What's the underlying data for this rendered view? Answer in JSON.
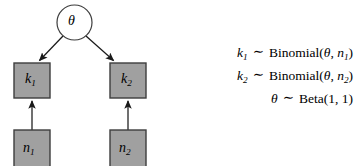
{
  "figure": {
    "type": "probabilistic-graphical-model",
    "background_color": "#ffffff",
    "node_fill_color": "#a0a0a0",
    "node_stroke_color": "#3d3d3d",
    "edge_color": "#1a1a1a"
  },
  "graph": {
    "nodes": [
      {
        "id": "theta",
        "shape": "circle",
        "label": "θ",
        "subscript": "",
        "observed": false,
        "cx": 74.5,
        "cy": 22.5,
        "r": 17.5
      },
      {
        "id": "k1",
        "shape": "square",
        "label": "k",
        "subscript": "1",
        "observed": true,
        "x": 14,
        "y": 63,
        "w": 36,
        "h": 35
      },
      {
        "id": "k2",
        "shape": "square",
        "label": "k",
        "subscript": "2",
        "observed": true,
        "x": 110,
        "y": 63,
        "w": 36,
        "h": 35
      },
      {
        "id": "n1",
        "shape": "square",
        "label": "n",
        "subscript": "1",
        "observed": true,
        "x": 14,
        "y": 130,
        "w": 36,
        "h": 36
      },
      {
        "id": "n2",
        "shape": "square",
        "label": "n",
        "subscript": "2",
        "observed": true,
        "x": 110,
        "y": 130,
        "w": 36,
        "h": 36
      }
    ],
    "edges": [
      {
        "from": "theta",
        "to": "k1",
        "style": "arrow"
      },
      {
        "from": "theta",
        "to": "k2",
        "style": "arrow"
      },
      {
        "from": "n1",
        "to": "k1",
        "style": "arrow"
      },
      {
        "from": "n2",
        "to": "k2",
        "style": "arrow"
      }
    ]
  },
  "equations": [
    {
      "lhs": "k",
      "lhs_sub": "1",
      "relation": "∼",
      "distribution": "Binomial",
      "params": [
        {
          "text": "θ",
          "italic": true,
          "sub": ""
        },
        {
          "text": "n",
          "italic": true,
          "sub": "2"
        }
      ],
      "rendered": "k₁ ∼ Binomial(θ, n₁)"
    },
    {
      "lhs": "k",
      "lhs_sub": "2",
      "relation": "∼",
      "distribution": "Binomial",
      "params": [
        {
          "text": "θ",
          "italic": true,
          "sub": ""
        },
        {
          "text": "n",
          "italic": true,
          "sub": "2"
        }
      ],
      "rendered": "k₂ ∼ Binomial(θ, n₂)"
    },
    {
      "lhs": "θ",
      "lhs_sub": "",
      "relation": "∼",
      "distribution": "Beta",
      "params": [
        {
          "text": "1",
          "italic": false,
          "sub": ""
        },
        {
          "text": "1",
          "italic": false,
          "sub": ""
        }
      ],
      "rendered": "θ ∼ Beta(1, 1)"
    }
  ]
}
